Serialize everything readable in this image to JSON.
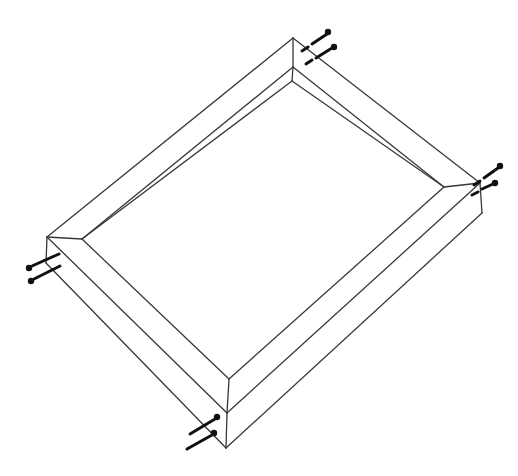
{
  "canvas": {
    "width": 518,
    "height": 476,
    "background_color": "#ffffff"
  },
  "style": {
    "frame_line_color": "#383838",
    "frame_line_width": 1.3,
    "nail_color": "#101010",
    "nail_shaft_width": 3,
    "nail_head_radius": 3.2
  },
  "frame": {
    "edges": [
      {
        "name": "outer-top-left-edge",
        "from": [
          47,
          237
        ],
        "to": [
          293,
          38
        ]
      },
      {
        "name": "outer-top-right-edge",
        "from": [
          293,
          38
        ],
        "to": [
          480,
          183
        ]
      },
      {
        "name": "outer-bottom-right-edge",
        "from": [
          480,
          183
        ],
        "to": [
          227,
          413
        ]
      },
      {
        "name": "outer-bottom-left-edge",
        "from": [
          227,
          413
        ],
        "to": [
          47,
          237
        ]
      },
      {
        "name": "inner-top-left-edge",
        "from": [
          82,
          239
        ],
        "to": [
          293,
          67
        ]
      },
      {
        "name": "inner-top-right-edge",
        "from": [
          293,
          67
        ],
        "to": [
          444,
          187
        ]
      },
      {
        "name": "inner-bottom-right-edge",
        "from": [
          444,
          187
        ],
        "to": [
          229,
          379
        ]
      },
      {
        "name": "inner-bottom-left-edge",
        "from": [
          229,
          379
        ],
        "to": [
          82,
          239
        ]
      },
      {
        "name": "miter-joint-top-corner",
        "from": [
          293,
          38
        ],
        "to": [
          293,
          67
        ]
      },
      {
        "name": "miter-joint-right-corner",
        "from": [
          480,
          183
        ],
        "to": [
          444,
          187
        ]
      },
      {
        "name": "miter-joint-bottom-corner",
        "from": [
          227,
          413
        ],
        "to": [
          229,
          379
        ]
      },
      {
        "name": "miter-joint-left-corner",
        "from": [
          47,
          237
        ],
        "to": [
          82,
          239
        ]
      },
      {
        "name": "inner-wall-vertical-top",
        "from": [
          293,
          67
        ],
        "to": [
          292,
          81
        ]
      },
      {
        "name": "inner-wall-bottom-edge-left",
        "from": [
          292,
          81
        ],
        "to": [
          82,
          239
        ]
      },
      {
        "name": "inner-wall-bottom-edge-right",
        "from": [
          292,
          81
        ],
        "to": [
          444,
          187
        ]
      },
      {
        "name": "side-thickness-edge-right",
        "from": [
          480,
          183
        ],
        "to": [
          482,
          213
        ]
      },
      {
        "name": "side-thickness-edge-bottom",
        "from": [
          227,
          413
        ],
        "to": [
          226,
          448
        ]
      },
      {
        "name": "side-thickness-edge-left",
        "from": [
          47,
          237
        ],
        "to": [
          46,
          263
        ]
      },
      {
        "name": "bottom-outline-left-side",
        "from": [
          46,
          263
        ],
        "to": [
          226,
          448
        ]
      },
      {
        "name": "bottom-outline-right-side",
        "from": [
          226,
          448
        ],
        "to": [
          482,
          213
        ]
      }
    ]
  },
  "nails": [
    {
      "name": "top-corner-nail-1",
      "head": [
        328,
        32
      ],
      "shaft": [
        [
          327,
          34,
          312,
          44
        ],
        [
          308,
          47,
          302,
          51
        ]
      ]
    },
    {
      "name": "top-corner-nail-2",
      "head": [
        334,
        47
      ],
      "shaft": [
        [
          332,
          48,
          316,
          58
        ],
        [
          312,
          60,
          306,
          64
        ]
      ]
    },
    {
      "name": "right-corner-nail-1",
      "head": [
        500,
        166
      ],
      "shaft": [
        [
          498,
          168,
          484,
          178
        ],
        [
          480,
          181,
          474,
          185
        ]
      ]
    },
    {
      "name": "right-corner-nail-2",
      "head": [
        495,
        183
      ],
      "shaft": [
        [
          493,
          184,
          482,
          189
        ],
        [
          478,
          192,
          472,
          195
        ]
      ]
    },
    {
      "name": "left-corner-nail-1",
      "head": [
        29,
        268
      ],
      "shaft": [
        [
          32,
          266,
          59,
          254
        ]
      ]
    },
    {
      "name": "left-corner-nail-2",
      "head": [
        31,
        281
      ],
      "shaft": [
        [
          34,
          279,
          60,
          266
        ]
      ]
    },
    {
      "name": "bottom-corner-nail-1",
      "head": [
        217,
        417
      ],
      "shaft": [
        [
          215,
          419,
          190,
          434
        ]
      ]
    },
    {
      "name": "bottom-corner-nail-2",
      "head": [
        214,
        433
      ],
      "shaft": [
        [
          212,
          435,
          187,
          449
        ]
      ]
    }
  ]
}
